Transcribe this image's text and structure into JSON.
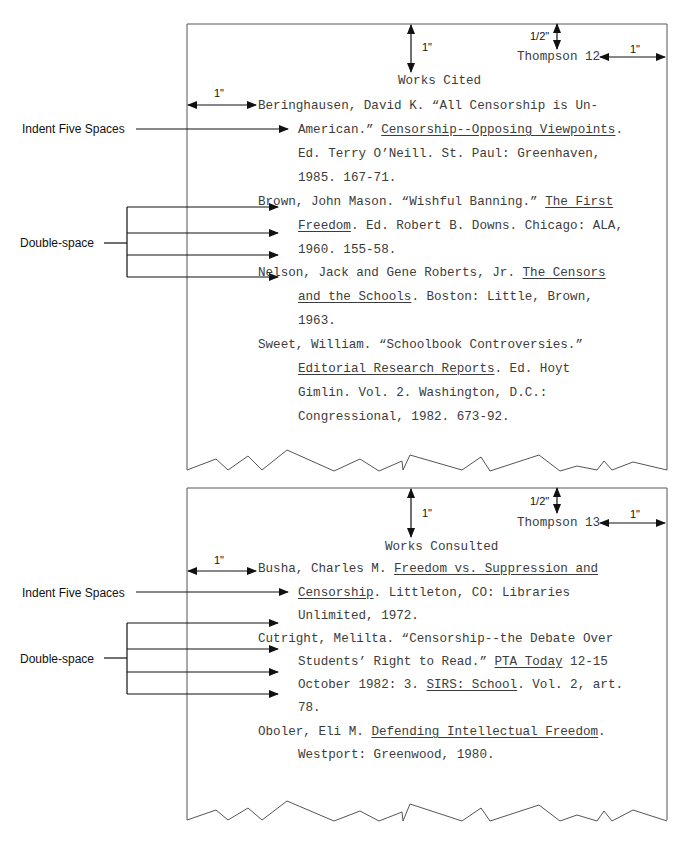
{
  "pages": [
    {
      "header": "Thompson 12",
      "title": "Works Cited",
      "lines": [
        {
          "x": 258,
          "y": 100,
          "parts": [
            {
              "t": "Beringhausen, David K. “All Censorship is Un-"
            }
          ]
        },
        {
          "x": 298,
          "y": 124,
          "parts": [
            {
              "t": "American.” "
            },
            {
              "t": "Censorship--Opposing Viewpoints",
              "u": true
            },
            {
              "t": "."
            }
          ]
        },
        {
          "x": 298,
          "y": 148,
          "parts": [
            {
              "t": "Ed. Terry O’Neill. St. Paul: Greenhaven,"
            }
          ]
        },
        {
          "x": 298,
          "y": 172,
          "parts": [
            {
              "t": "1985. 167-71."
            }
          ]
        },
        {
          "x": 258,
          "y": 196,
          "parts": [
            {
              "t": "Brown, John Mason. “Wishful Banning.” "
            },
            {
              "t": "The First",
              "u": true
            }
          ]
        },
        {
          "x": 298,
          "y": 220,
          "parts": [
            {
              "t": "Freedom",
              "u": true
            },
            {
              "t": ". Ed. Robert B. Downs. Chicago: ALA,"
            }
          ]
        },
        {
          "x": 298,
          "y": 244,
          "parts": [
            {
              "t": "1960. 155-58."
            }
          ]
        },
        {
          "x": 258,
          "y": 267,
          "parts": [
            {
              "t": "Nelson, Jack and Gene Roberts, Jr. "
            },
            {
              "t": "The Censors",
              "u": true
            }
          ]
        },
        {
          "x": 298,
          "y": 291,
          "parts": [
            {
              "t": "and the Schools",
              "u": true
            },
            {
              "t": ". Boston: Little, Brown,"
            }
          ]
        },
        {
          "x": 298,
          "y": 315,
          "parts": [
            {
              "t": "1963."
            }
          ]
        },
        {
          "x": 258,
          "y": 339,
          "parts": [
            {
              "t": "Sweet, William. “Schoolbook Controversies.”"
            }
          ]
        },
        {
          "x": 298,
          "y": 363,
          "parts": [
            {
              "t": "Editorial Research Reports",
              "u": true
            },
            {
              "t": ". Ed. Hoyt"
            }
          ]
        },
        {
          "x": 298,
          "y": 387,
          "parts": [
            {
              "t": "Gimlin. Vol. 2. Washington, D.C.:"
            }
          ]
        },
        {
          "x": 298,
          "y": 411,
          "parts": [
            {
              "t": "Congressional, 1982. 673-92."
            }
          ]
        }
      ]
    },
    {
      "header": "Thompson 13",
      "title": "Works Consulted",
      "lines": [
        {
          "x": 258,
          "y": 563,
          "parts": [
            {
              "t": "Busha, Charles M. "
            },
            {
              "t": "Freedom vs. Suppression and",
              "u": true
            }
          ]
        },
        {
          "x": 298,
          "y": 587,
          "parts": [
            {
              "t": "Censorship",
              "u": true
            },
            {
              "t": ". Littleton, CO: Libraries"
            }
          ]
        },
        {
          "x": 298,
          "y": 610,
          "parts": [
            {
              "t": "Unlimited, 1972."
            }
          ]
        },
        {
          "x": 258,
          "y": 633,
          "parts": [
            {
              "t": "Cutright, Melilta. “Censorship--the Debate Over"
            }
          ]
        },
        {
          "x": 298,
          "y": 656,
          "parts": [
            {
              "t": "Students’ Right to Read.” "
            },
            {
              "t": "PTA Today",
              "u": true
            },
            {
              "t": " 12-15"
            }
          ]
        },
        {
          "x": 298,
          "y": 679,
          "parts": [
            {
              "t": "October 1982: 3. "
            },
            {
              "t": "SIRS: School",
              "u": true
            },
            {
              "t": ". Vol. 2, art."
            }
          ]
        },
        {
          "x": 298,
          "y": 702,
          "parts": [
            {
              "t": "78."
            }
          ]
        },
        {
          "x": 258,
          "y": 726,
          "parts": [
            {
              "t": "Oboler, Eli M. "
            },
            {
              "t": "Defending Intellectual Freedom",
              "u": true
            },
            {
              "t": "."
            }
          ]
        },
        {
          "x": 298,
          "y": 749,
          "parts": [
            {
              "t": "Westport: Greenwood, 1980."
            }
          ]
        }
      ]
    }
  ],
  "annotations": {
    "indent_label": "Indent Five Spaces",
    "double_space_label": "Double-space",
    "one_inch": "1\"",
    "half_inch": "1/2\""
  },
  "colors": {
    "text": "#3c3c3c",
    "lines": "#333333",
    "page_border": "#555555"
  }
}
